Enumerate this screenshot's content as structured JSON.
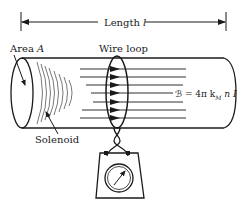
{
  "diagram": {
    "labels": {
      "length": "Length",
      "length_var": "l",
      "area": "Area",
      "area_var": "A",
      "wire_loop": "Wire loop",
      "solenoid": "Solenoid",
      "field_eq_symbol": "ℬ",
      "field_eq_rhs": "= 4π k",
      "field_eq_sub": "M",
      "field_eq_tail": "n I"
    },
    "components": [
      "solenoid",
      "wire-loop",
      "field-lines",
      "galvanometer",
      "length-dimension"
    ],
    "colors": {
      "ink": "#1a1a1a",
      "background": "#ffffff"
    }
  }
}
